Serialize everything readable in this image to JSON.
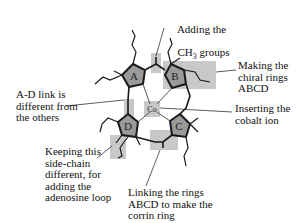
{
  "diagram": {
    "type": "annotated-molecule",
    "colors": {
      "ring_fill": "#9a9a9a",
      "highlight": "#c8c8c8",
      "line": "#1a1a1a"
    },
    "rings": [
      {
        "id": "A",
        "label": "A"
      },
      {
        "id": "B",
        "label": "B"
      },
      {
        "id": "C",
        "label": "C"
      },
      {
        "id": "D",
        "label": "D"
      }
    ],
    "center": {
      "label": "Co"
    },
    "annotations": [
      {
        "id": "ch3",
        "line1": "Adding the",
        "line2": "CH",
        "sub": "3",
        "line2b": " groups"
      },
      {
        "id": "chiral",
        "text": "Making the\nchiral rings\nABCD"
      },
      {
        "id": "ad-link",
        "text": "A-D link is\ndifferent from\nthe others"
      },
      {
        "id": "cobalt",
        "text": "Inserting the\ncobalt ion"
      },
      {
        "id": "sidechain",
        "text": "Keeping this\nside-chain\ndifferent, for\nadding the\nadenosine loop"
      },
      {
        "id": "linking",
        "text": "Linking the rings\nABCD to make the\ncorrin ring"
      }
    ]
  }
}
